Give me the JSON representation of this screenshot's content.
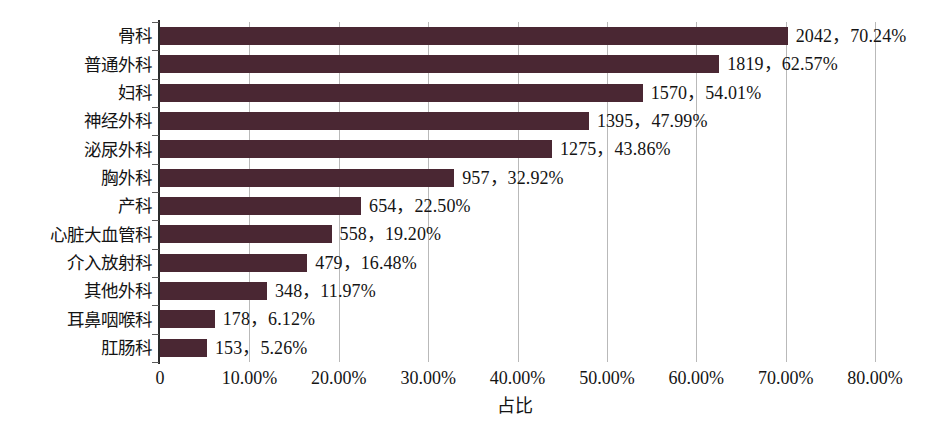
{
  "chart_data": {
    "type": "bar",
    "orientation": "horizontal",
    "title": "",
    "xlabel": "占比",
    "ylabel": "",
    "xlim": [
      0,
      80
    ],
    "xtick_labels": [
      "0",
      "10.00%",
      "20.00%",
      "30.00%",
      "40.00%",
      "50.00%",
      "60.00%",
      "70.00%",
      "80.00%"
    ],
    "xtick_values": [
      0,
      10,
      20,
      30,
      40,
      50,
      60,
      70,
      80
    ],
    "grid": "vertical-only",
    "legend": "none",
    "bar_color": "#4a2733",
    "categories": [
      "骨科",
      "普通外科",
      "妇科",
      "神经外科",
      "泌尿外科",
      "胸外科",
      "产科",
      "心脏大血管科",
      "介入放射科",
      "其他外科",
      "耳鼻咽喉科",
      "肛肠科"
    ],
    "values": [
      70.24,
      62.57,
      54.01,
      47.99,
      43.86,
      32.92,
      22.5,
      19.2,
      16.48,
      11.97,
      6.12,
      5.26
    ],
    "counts": [
      2042,
      1819,
      1570,
      1395,
      1275,
      957,
      654,
      558,
      479,
      348,
      178,
      153
    ],
    "data_labels": [
      "2042，70.24%",
      "1819，62.57%",
      "1570，54.01%",
      "1395，47.99%",
      "1275，43.86%",
      "957，32.92%",
      "654，22.50%",
      "558，19.20%",
      "479，16.48%",
      "348，11.97%",
      "178，6.12%",
      "153，5.26%"
    ]
  }
}
